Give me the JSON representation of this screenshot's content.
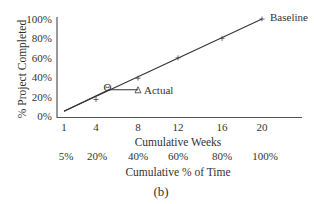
{
  "chart_data": {
    "type": "line",
    "title": "",
    "caption": "(b)",
    "xlabel": "Cumulative Weeks",
    "xlabel2": "Cumulative % of Time",
    "ylabel": "% Project Completed",
    "x_ticks": [
      "1",
      "4",
      "8",
      "12",
      "16",
      "20"
    ],
    "x2_ticks": [
      "5%",
      "20%",
      "40%",
      "60%",
      "80%",
      "100%"
    ],
    "y_ticks": [
      "0%",
      "20%",
      "40%",
      "60%",
      "80%",
      "100%"
    ],
    "ylim": [
      0,
      100
    ],
    "xlim": [
      1,
      20
    ],
    "series": [
      {
        "name": "Baseline",
        "x": [
          1,
          4,
          8,
          12,
          16,
          20
        ],
        "y": [
          5,
          20,
          40,
          60,
          80,
          100
        ]
      },
      {
        "name": "Actual",
        "x": [
          1,
          5,
          8
        ],
        "y": [
          5,
          27,
          27
        ]
      }
    ],
    "annotations": [
      {
        "label": "Θ",
        "x": 5,
        "y": 27
      },
      {
        "label": "Δ Actual",
        "x": 8,
        "y": 27
      }
    ]
  }
}
